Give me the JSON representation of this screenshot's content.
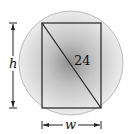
{
  "diagram": {
    "diagonal_label": "24",
    "height_label": "h",
    "width_label": "w",
    "colors": {
      "circle_center": "#8a8a8a",
      "circle_edge": "#e6e6e6",
      "circle_outline": "#bdbdbd",
      "lines": "#222222"
    }
  }
}
